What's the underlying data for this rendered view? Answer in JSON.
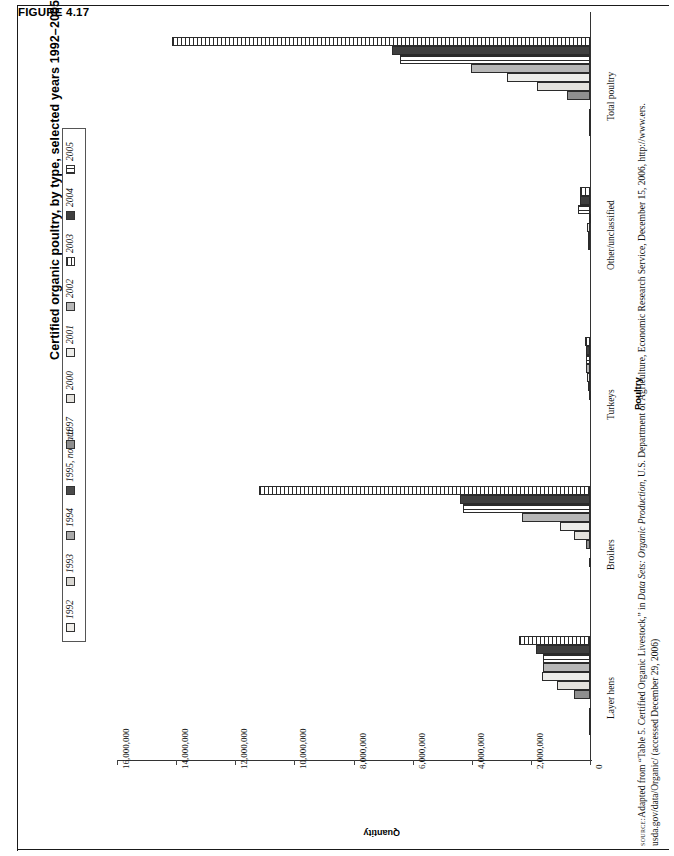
{
  "figure": {
    "number": "FIGURE 4.17",
    "title": "Certified organic poultry, by type, selected years 1992–2005"
  },
  "source": {
    "label": "source:",
    "line1_a": "Adapted from “Table 5. Certified Organic Livestock,” in ",
    "line1_i": "Data Sets: Organic Production",
    "line1_b": ", U.S. Department of Agriculture, Economic Research Service, December 15, 2006, http://www.ers.",
    "line2": "usda.gov/data/Organic/ (accessed December 29, 2006)"
  },
  "chart_data": {
    "type": "bar",
    "orientation": "vertical-grouped",
    "title": "Certified organic poultry, by type, selected years 1992–2005",
    "xlabel": "Poultry",
    "ylabel": "Quantity",
    "ylim": [
      0,
      16000000
    ],
    "grid": false,
    "legend_position": "top",
    "ytick_labels": [
      "16,000,000",
      "14,000,000",
      "12,000,000",
      "10,000,000",
      "8,000,000",
      "6,000,000",
      "4,000,000",
      "2,000,000",
      "0"
    ],
    "ytick_values": [
      16000000,
      14000000,
      12000000,
      10000000,
      8000000,
      6000000,
      4000000,
      2000000,
      0
    ],
    "categories": [
      "Layer hens",
      "Broilers",
      "Turkeys",
      "Other/unclassified",
      "Total poultry"
    ],
    "series": [
      {
        "name": "1992",
        "fill": "#f0eeea",
        "pattern": "solid",
        "values": [
          43981,
          0,
          0,
          0,
          43981
        ]
      },
      {
        "name": "1993",
        "fill": "#d8d6d1",
        "pattern": "solid",
        "values": [
          20625,
          9000,
          1100,
          0,
          30725
        ]
      },
      {
        "name": "1994",
        "fill": "#a9a9a9",
        "pattern": "solid",
        "values": [
          29006,
          17000,
          2200,
          0,
          48206
        ]
      },
      {
        "name": "1995, no data",
        "fill": "#4a4a4a",
        "pattern": "solid",
        "values": [
          0,
          0,
          0,
          0,
          0
        ]
      },
      {
        "name": "1997",
        "fill": "#8e8e8e",
        "pattern": "solid",
        "values": [
          537826,
          137000,
          23000,
          80000,
          777826
        ]
      },
      {
        "name": "2000",
        "fill": "#e4e2dd",
        "pattern": "solid",
        "values": [
          1113746,
          540000,
          73000,
          80000,
          1806746
        ]
      },
      {
        "name": "2001",
        "fill": "#ededea",
        "pattern": "solid",
        "values": [
          1611662,
          1000000,
          98000,
          90000,
          2799662
        ]
      },
      {
        "name": "2002",
        "fill": "#b7b7b7",
        "pattern": "solid",
        "values": [
          1591181,
          2300000,
          120000,
          30000,
          4041181
        ]
      },
      {
        "name": "2003",
        "fill": "#ffffff",
        "pattern": "hlines",
        "values": [
          1591181,
          4300000,
          130000,
          400000,
          6421181
        ]
      },
      {
        "name": "2004",
        "fill": "#3f3f3f",
        "pattern": "solid",
        "values": [
          1834000,
          4400000,
          150000,
          330000,
          6714000
        ]
      },
      {
        "name": "2005",
        "fill": "#ffffff",
        "pattern": "vlines",
        "values": [
          2415000,
          11200000,
          180000,
          330000,
          14125000
        ]
      }
    ]
  },
  "legend": {
    "items": [
      {
        "label": "1992"
      },
      {
        "label": "1993"
      },
      {
        "label": "1994"
      },
      {
        "label": "1995, no data"
      },
      {
        "label": "1997"
      },
      {
        "label": "2000"
      },
      {
        "label": "2001"
      },
      {
        "label": "2002"
      },
      {
        "label": "2003"
      },
      {
        "label": "2004"
      },
      {
        "label": "2005"
      }
    ]
  }
}
